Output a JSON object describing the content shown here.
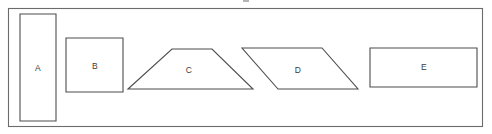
{
  "canvas": {
    "width": 492,
    "height": 134,
    "background_color": "#ffffff"
  },
  "frame": {
    "name": "outer-border",
    "x": 8,
    "y": 8,
    "width": 475,
    "height": 119,
    "stroke_color": "#6b6b6b"
  },
  "style": {
    "shape_stroke_color": "#4d4d4d",
    "shape_fill_color": "#ffffff",
    "label_color": "#3a3a3a"
  },
  "shapes": [
    {
      "label": "A",
      "kind": "rectangle",
      "points": "20,14 56,14 56,121 20,121",
      "label_x": 38,
      "label_y": 68
    },
    {
      "label": "B",
      "kind": "square",
      "points": "66,38 123,38 123,92 66,92",
      "label_x": 95,
      "label_y": 66
    },
    {
      "label": "C",
      "kind": "trapezoid",
      "points": "128,89 172,49 212,49 253,89",
      "label_x": 189,
      "label_y": 70
    },
    {
      "label": "D",
      "kind": "parallelogram",
      "points": "242,48 322,48 358,89 278,89",
      "label_x": 298,
      "label_y": 70
    },
    {
      "label": "E",
      "kind": "rectangle",
      "points": "370,48 477,48 477,87 370,87",
      "label_x": 424,
      "label_y": 67
    }
  ]
}
